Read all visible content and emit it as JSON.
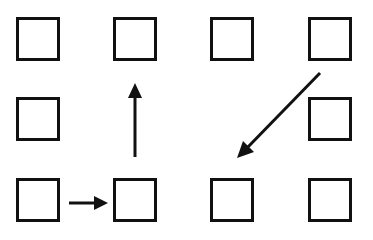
{
  "diagram": {
    "grid": {
      "rows": 3,
      "cols": 4
    },
    "cells": [
      {
        "id": "r1c1",
        "row": 1,
        "col": 1,
        "present": true
      },
      {
        "id": "r1c2",
        "row": 1,
        "col": 2,
        "present": true
      },
      {
        "id": "r1c3",
        "row": 1,
        "col": 3,
        "present": true
      },
      {
        "id": "r1c4",
        "row": 1,
        "col": 4,
        "present": true
      },
      {
        "id": "r2c1",
        "row": 2,
        "col": 1,
        "present": true
      },
      {
        "id": "r2c2",
        "row": 2,
        "col": 2,
        "present": false
      },
      {
        "id": "r2c3",
        "row": 2,
        "col": 3,
        "present": false
      },
      {
        "id": "r2c4",
        "row": 2,
        "col": 4,
        "present": true
      },
      {
        "id": "r3c1",
        "row": 3,
        "col": 1,
        "present": true
      },
      {
        "id": "r3c2",
        "row": 3,
        "col": 2,
        "present": true
      },
      {
        "id": "r3c3",
        "row": 3,
        "col": 3,
        "present": true
      },
      {
        "id": "r3c4",
        "row": 3,
        "col": 4,
        "present": true
      }
    ],
    "arrows": [
      {
        "id": "arrow-right",
        "from": "r3c1",
        "to": "r3c2",
        "direction": "right"
      },
      {
        "id": "arrow-up",
        "from": "r3c2",
        "to": "r1c2",
        "direction": "up"
      },
      {
        "id": "arrow-diagonal",
        "from": "r1c4",
        "to": "r3c3",
        "direction": "down-left"
      }
    ],
    "colors": {
      "stroke": "#111111",
      "background": "#ffffff"
    }
  }
}
